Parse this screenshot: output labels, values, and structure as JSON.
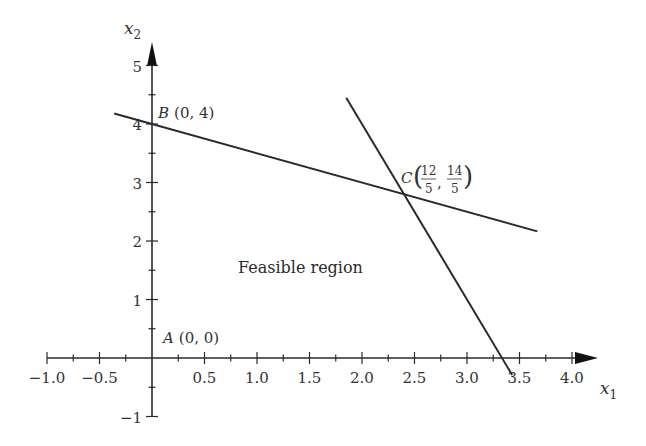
{
  "chart_data": {
    "type": "line",
    "title": "",
    "xlabel": "x1",
    "ylabel": "x2",
    "xlim": [
      -1.0,
      4.0
    ],
    "ylim": [
      -1,
      5
    ],
    "grid": false,
    "x_ticks": [
      -1.0,
      -0.5,
      0.5,
      1.0,
      1.5,
      2.0,
      2.5,
      3.0,
      3.5,
      4.0
    ],
    "x_tick_labels": [
      "−1.0",
      "−0.5",
      "0.5",
      "1.0",
      "1.5",
      "2.0",
      "2.5",
      "3.0",
      "3.5",
      "4.0"
    ],
    "x_minor_step": 0.25,
    "y_ticks": [
      -1,
      1,
      2,
      3,
      4,
      5
    ],
    "y_tick_labels": [
      "−1",
      "1",
      "2",
      "3",
      "4",
      "5"
    ],
    "y_minor_step": 0.5,
    "series": [
      {
        "name": "x1 + 2x2 = 8",
        "x": [
          -0.36,
          3.67
        ],
        "y": [
          4.18,
          2.165
        ]
      },
      {
        "name": "3x1 + x2 = 10",
        "x": [
          1.85,
          3.43
        ],
        "y": [
          4.45,
          -0.29
        ]
      }
    ],
    "points": [
      {
        "label": "A",
        "coords": "(0, 0)",
        "x": 0,
        "y": 0
      },
      {
        "label": "B",
        "coords": "(0, 4)",
        "x": 0,
        "y": 4
      },
      {
        "label": "C",
        "coords_num": [
          "12",
          "14"
        ],
        "coords_den": [
          "5",
          "5"
        ],
        "x": 2.4,
        "y": 2.8
      }
    ],
    "annotations": [
      {
        "text": "Feasible region",
        "x": 0.8,
        "y": 1.5
      }
    ]
  },
  "labels": {
    "x_axis": "x",
    "x_axis_sub": "1",
    "y_axis": "x",
    "y_axis_sub": "2",
    "region": "Feasible region",
    "point_a_name": "A",
    "point_a_coords": "(0, 0)",
    "point_b_name": "B",
    "point_b_coords": "(0, 4)",
    "point_c_name": "C",
    "point_c_num1": "12",
    "point_c_den1": "5",
    "point_c_num2": "14",
    "point_c_den2": "5"
  }
}
